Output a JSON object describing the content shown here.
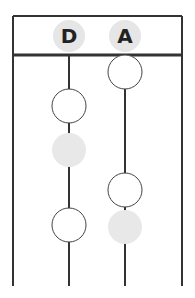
{
  "diagram": {
    "type": "ladder-timeline",
    "colors": {
      "line": "#333333",
      "label_bg": "#e6e6e6",
      "filled_node": "#e8e8e8",
      "open_node_fill": "#ffffff",
      "background": "#ffffff"
    },
    "frame": {
      "left": 13,
      "right": 182,
      "top": 16,
      "header_bottom": 55,
      "bottom": 286
    },
    "columns": [
      {
        "label": "D",
        "x": 69,
        "nodes": [
          {
            "y": 106,
            "style": "open"
          },
          {
            "y": 150,
            "style": "filled"
          },
          {
            "y": 225,
            "style": "open"
          }
        ]
      },
      {
        "label": "A",
        "x": 125,
        "nodes": [
          {
            "y": 72,
            "style": "open"
          },
          {
            "y": 190,
            "style": "open"
          },
          {
            "y": 227,
            "style": "filled"
          }
        ]
      }
    ]
  }
}
